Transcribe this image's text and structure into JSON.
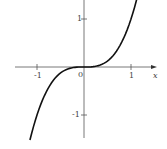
{
  "chart_data": {
    "type": "line",
    "title": "",
    "xlabel": "x",
    "ylabel": "",
    "xlim": [
      -1.3,
      1.3
    ],
    "ylim": [
      -1.5,
      1.5
    ],
    "grid": false,
    "x_ticks": [
      "-1",
      "1"
    ],
    "y_ticks": [
      "1",
      "-1"
    ],
    "origin_label": "0",
    "series": [
      {
        "name": "y = x^3",
        "x": [
          -1.15,
          -1.0,
          -0.8,
          -0.6,
          -0.4,
          -0.2,
          0,
          0.2,
          0.4,
          0.6,
          0.8,
          1.0,
          1.15
        ],
        "values": [
          -1.52,
          -1.0,
          -0.51,
          -0.22,
          -0.06,
          -0.01,
          0,
          0.01,
          0.06,
          0.22,
          0.51,
          1.0,
          1.52
        ]
      }
    ]
  }
}
